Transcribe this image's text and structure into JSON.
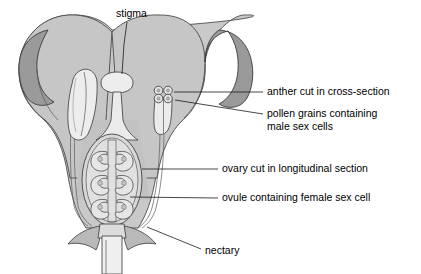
{
  "diagram": {
    "background_color": "#ffffff"
  },
  "colors": {
    "corolla_outer": "#c9c9c9",
    "corolla_mid": "#bdbdbd",
    "petal_inner_dark": "#9a9a9a",
    "ovary_fill": "#d8d8d8",
    "organ_light": "#ededed",
    "stamen_fill": "#e8e8e8",
    "outline": "#4a4a4a",
    "leader_line": "#1a1a1a",
    "text": "#000000"
  },
  "labels": [
    {
      "id": "stigma",
      "text": "stigma",
      "text_x": 116,
      "text_y": 14,
      "anchor": "start",
      "leader": "M 127 22 L 124 43 L 123 76",
      "target": "stigma-cap"
    },
    {
      "id": "anther-cross-section",
      "text": "anther cut in cross-section",
      "text_x": 267,
      "text_y": 92,
      "anchor": "start",
      "leader": "M 263 92 L 175 93",
      "target": "anther-lobes"
    },
    {
      "id": "pollen-grains",
      "text": "pollen grains containing",
      "text_line2": "male sex cells",
      "text_x": 267,
      "text_y": 114,
      "anchor": "start",
      "leader": "M 263 114 L 176 101",
      "target": "pollen-grain-circles"
    },
    {
      "id": "ovary-longitudinal",
      "text": "ovary cut in longitudinal section",
      "text_x": 222,
      "text_y": 169,
      "anchor": "start",
      "leader": "M 218 169 L 143 169",
      "target": "ovary-wall"
    },
    {
      "id": "ovule",
      "text": "ovule containing female sex cell",
      "text_x": 222,
      "text_y": 198,
      "anchor": "start",
      "leader": "M 218 198 L 131 197",
      "target": "ovule-body"
    },
    {
      "id": "nectary",
      "text": "nectary",
      "text_x": 205,
      "text_y": 251,
      "anchor": "start",
      "leader": "M 201 249 L 148 228",
      "target": "nectary-region"
    }
  ],
  "structures": {
    "corolla": "fused petal tube with two recurved lobes",
    "stigma": "stigma-cap",
    "style": "style-column",
    "ovary": "ovary-chamber",
    "ovule_count": 6,
    "ovules_left": 3,
    "ovules_right": 3,
    "anther_lobe_count": 4,
    "stamen_left": "anther-longitudinal",
    "stamen_right": "anther-cross-section",
    "nectary": "nectary-base",
    "receptacle": "flower-stalk"
  }
}
